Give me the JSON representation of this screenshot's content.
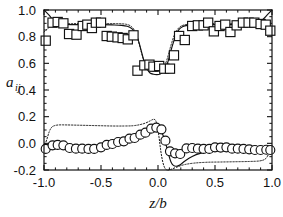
{
  "chart_data": {
    "type": "scatter",
    "title": "",
    "xlabel": "z/b",
    "ylabel": "a_ij",
    "xlim": [
      -1.0,
      1.0
    ],
    "ylim": [
      -0.2,
      1.0
    ],
    "grid": false,
    "legend": "none",
    "xticks": [
      -1.0,
      -0.5,
      0.0,
      0.5,
      1.0
    ],
    "xticklabels": [
      "-1.0",
      "-0.5",
      "0.0",
      "0.5",
      "1.0"
    ],
    "yticks": [
      -0.2,
      0.0,
      0.2,
      0.4,
      0.6,
      0.8,
      1.0
    ],
    "yticklabels": [
      "-0.2",
      "0.0",
      "0.2",
      "0.4",
      "0.6",
      "0.8",
      "1.0"
    ],
    "x_minor_step": 0.1,
    "y_minor_step": 0.05,
    "series": [
      {
        "name": "squares-data",
        "marker": "square",
        "style": "open-marker",
        "points": [
          [
            -0.985,
            0.77
          ],
          [
            -0.925,
            0.905
          ],
          [
            -0.88,
            0.91
          ],
          [
            -0.83,
            0.9
          ],
          [
            -0.78,
            0.82
          ],
          [
            -0.715,
            0.815
          ],
          [
            -0.66,
            0.88
          ],
          [
            -0.62,
            0.89
          ],
          [
            -0.58,
            0.865
          ],
          [
            -0.545,
            0.905
          ],
          [
            -0.5,
            0.905
          ],
          [
            -0.45,
            0.805
          ],
          [
            -0.405,
            0.8
          ],
          [
            -0.355,
            0.795
          ],
          [
            -0.31,
            0.79
          ],
          [
            -0.265,
            0.78
          ],
          [
            -0.215,
            0.81
          ],
          [
            -0.18,
            0.545
          ],
          [
            -0.12,
            0.585
          ],
          [
            -0.075,
            0.59
          ],
          [
            -0.04,
            0.575
          ],
          [
            0.01,
            0.58
          ],
          [
            0.055,
            0.56
          ],
          [
            0.105,
            0.56
          ],
          [
            0.14,
            0.66
          ],
          [
            0.185,
            0.805
          ],
          [
            0.235,
            0.775
          ],
          [
            0.3,
            0.88
          ],
          [
            0.35,
            0.885
          ],
          [
            0.4,
            0.885
          ],
          [
            0.44,
            0.905
          ],
          [
            0.49,
            0.84
          ],
          [
            0.54,
            0.88
          ],
          [
            0.59,
            0.89
          ],
          [
            0.635,
            0.835
          ],
          [
            0.69,
            0.885
          ],
          [
            0.745,
            0.905
          ],
          [
            0.795,
            0.905
          ],
          [
            0.845,
            0.905
          ],
          [
            0.9,
            0.895
          ],
          [
            0.945,
            0.89
          ],
          [
            0.985,
            0.845
          ]
        ]
      },
      {
        "name": "circles-data",
        "marker": "circle",
        "style": "open-marker",
        "points": [
          [
            -0.985,
            -0.042
          ],
          [
            -0.925,
            -0.015
          ],
          [
            -0.88,
            -0.012
          ],
          [
            -0.83,
            -0.015
          ],
          [
            -0.775,
            -0.035
          ],
          [
            -0.72,
            -0.04
          ],
          [
            -0.665,
            -0.04
          ],
          [
            -0.61,
            -0.042
          ],
          [
            -0.56,
            -0.042
          ],
          [
            -0.5,
            -0.03
          ],
          [
            -0.45,
            -0.012
          ],
          [
            -0.4,
            -0.005
          ],
          [
            -0.35,
            0.01
          ],
          [
            -0.3,
            0.015
          ],
          [
            -0.25,
            0.035
          ],
          [
            -0.205,
            0.04
          ],
          [
            -0.155,
            0.065
          ],
          [
            -0.11,
            0.08
          ],
          [
            -0.06,
            0.11
          ],
          [
            -0.015,
            0.118
          ],
          [
            0.03,
            0.105
          ],
          [
            0.065,
            0.02
          ],
          [
            0.105,
            -0.06
          ],
          [
            0.15,
            -0.075
          ],
          [
            0.195,
            -0.08
          ],
          [
            0.25,
            -0.038
          ],
          [
            0.3,
            -0.035
          ],
          [
            0.35,
            -0.04
          ],
          [
            0.4,
            -0.042
          ],
          [
            0.45,
            -0.042
          ],
          [
            0.5,
            -0.03
          ],
          [
            0.55,
            -0.032
          ],
          [
            0.6,
            -0.03
          ],
          [
            0.65,
            -0.04
          ],
          [
            0.7,
            -0.04
          ],
          [
            0.75,
            -0.042
          ],
          [
            0.8,
            -0.045
          ],
          [
            0.85,
            -0.05
          ],
          [
            0.9,
            -0.05
          ],
          [
            0.95,
            -0.048
          ],
          [
            0.985,
            -0.05
          ]
        ]
      },
      {
        "name": "squares-solid-line",
        "marker": "none",
        "style": "solid",
        "points": [
          [
            -1.0,
            1.0
          ],
          [
            -0.96,
            0.965
          ],
          [
            -0.93,
            0.935
          ],
          [
            -0.9,
            0.912
          ],
          [
            -0.86,
            0.898
          ],
          [
            -0.8,
            0.892
          ],
          [
            -0.7,
            0.89
          ],
          [
            -0.6,
            0.89
          ],
          [
            -0.5,
            0.89
          ],
          [
            -0.4,
            0.888
          ],
          [
            -0.32,
            0.885
          ],
          [
            -0.27,
            0.878
          ],
          [
            -0.23,
            0.86
          ],
          [
            -0.2,
            0.828
          ],
          [
            -0.175,
            0.78
          ],
          [
            -0.155,
            0.72
          ],
          [
            -0.135,
            0.655
          ],
          [
            -0.115,
            0.595
          ],
          [
            -0.095,
            0.555
          ],
          [
            -0.07,
            0.528
          ],
          [
            -0.04,
            0.518
          ],
          [
            -0.01,
            0.515
          ],
          [
            0.02,
            0.52
          ],
          [
            0.05,
            0.54
          ],
          [
            0.075,
            0.58
          ],
          [
            0.095,
            0.635
          ],
          [
            0.115,
            0.7
          ],
          [
            0.138,
            0.765
          ],
          [
            0.16,
            0.818
          ],
          [
            0.185,
            0.855
          ],
          [
            0.215,
            0.875
          ],
          [
            0.26,
            0.885
          ],
          [
            0.33,
            0.89
          ],
          [
            0.43,
            0.89
          ],
          [
            0.53,
            0.89
          ],
          [
            0.63,
            0.89
          ],
          [
            0.73,
            0.892
          ],
          [
            0.82,
            0.898
          ],
          [
            0.88,
            0.91
          ],
          [
            0.92,
            0.93
          ],
          [
            0.96,
            0.965
          ],
          [
            1.0,
            1.0
          ]
        ]
      },
      {
        "name": "squares-dotted-line",
        "marker": "none",
        "style": "dotted",
        "points": [
          [
            -1.0,
            0.835
          ],
          [
            -0.97,
            0.858
          ],
          [
            -0.94,
            0.878
          ],
          [
            -0.9,
            0.89
          ],
          [
            -0.85,
            0.895
          ],
          [
            -0.76,
            0.897
          ],
          [
            -0.65,
            0.898
          ],
          [
            -0.54,
            0.898
          ],
          [
            -0.43,
            0.898
          ],
          [
            -0.34,
            0.897
          ],
          [
            -0.28,
            0.893
          ],
          [
            -0.24,
            0.88
          ],
          [
            -0.21,
            0.852
          ],
          [
            -0.185,
            0.805
          ],
          [
            -0.165,
            0.745
          ],
          [
            -0.145,
            0.68
          ],
          [
            -0.125,
            0.62
          ],
          [
            -0.105,
            0.578
          ],
          [
            -0.08,
            0.552
          ],
          [
            -0.05,
            0.542
          ],
          [
            -0.015,
            0.54
          ],
          [
            0.02,
            0.548
          ],
          [
            0.05,
            0.57
          ],
          [
            0.072,
            0.612
          ],
          [
            0.092,
            0.668
          ],
          [
            0.112,
            0.73
          ],
          [
            0.135,
            0.792
          ],
          [
            0.16,
            0.84
          ],
          [
            0.19,
            0.872
          ],
          [
            0.23,
            0.888
          ],
          [
            0.3,
            0.896
          ],
          [
            0.4,
            0.898
          ],
          [
            0.52,
            0.898
          ],
          [
            0.64,
            0.898
          ],
          [
            0.75,
            0.897
          ],
          [
            0.84,
            0.894
          ],
          [
            0.9,
            0.888
          ],
          [
            0.945,
            0.875
          ],
          [
            0.975,
            0.858
          ],
          [
            1.0,
            0.838
          ]
        ]
      },
      {
        "name": "circles-solid-line",
        "marker": "none",
        "style": "solid",
        "points": [
          [
            -1.0,
            -0.06
          ],
          [
            -0.96,
            -0.048
          ],
          [
            -0.9,
            -0.04
          ],
          [
            -0.82,
            -0.038
          ],
          [
            -0.72,
            -0.036
          ],
          [
            -0.62,
            -0.032
          ],
          [
            -0.52,
            -0.025
          ],
          [
            -0.43,
            -0.015
          ],
          [
            -0.35,
            -0.002
          ],
          [
            -0.28,
            0.012
          ],
          [
            -0.22,
            0.028
          ],
          [
            -0.17,
            0.048
          ],
          [
            -0.13,
            0.068
          ],
          [
            -0.1,
            0.088
          ],
          [
            -0.075,
            0.105
          ],
          [
            -0.05,
            0.118
          ],
          [
            -0.025,
            0.125
          ],
          [
            0.0,
            0.122
          ],
          [
            0.02,
            0.105
          ],
          [
            0.04,
            0.07
          ],
          [
            0.06,
            0.02
          ],
          [
            0.08,
            -0.04
          ],
          [
            0.098,
            -0.098
          ],
          [
            0.115,
            -0.142
          ],
          [
            0.135,
            -0.165
          ],
          [
            0.16,
            -0.172
          ],
          [
            0.195,
            -0.16
          ],
          [
            0.24,
            -0.13
          ],
          [
            0.3,
            -0.098
          ],
          [
            0.37,
            -0.075
          ],
          [
            0.45,
            -0.062
          ],
          [
            0.54,
            -0.055
          ],
          [
            0.64,
            -0.05
          ],
          [
            0.74,
            -0.048
          ],
          [
            0.84,
            -0.048
          ],
          [
            0.93,
            -0.05
          ],
          [
            1.0,
            -0.055
          ]
        ]
      },
      {
        "name": "circles-dotted-line",
        "marker": "none",
        "style": "dotted",
        "points": [
          [
            -1.0,
            -0.03
          ],
          [
            -0.975,
            0.03
          ],
          [
            -0.955,
            0.085
          ],
          [
            -0.935,
            0.118
          ],
          [
            -0.91,
            0.132
          ],
          [
            -0.87,
            0.138
          ],
          [
            -0.8,
            0.138
          ],
          [
            -0.7,
            0.136
          ],
          [
            -0.6,
            0.134
          ],
          [
            -0.5,
            0.132
          ],
          [
            -0.4,
            0.13
          ],
          [
            -0.3,
            0.13
          ],
          [
            -0.22,
            0.132
          ],
          [
            -0.16,
            0.14
          ],
          [
            -0.11,
            0.152
          ],
          [
            -0.07,
            0.168
          ],
          [
            -0.04,
            0.18
          ],
          [
            -0.02,
            0.17
          ],
          [
            -0.005,
            0.12
          ],
          [
            0.01,
            0.04
          ],
          [
            0.025,
            -0.06
          ],
          [
            0.042,
            -0.14
          ],
          [
            0.06,
            -0.185
          ],
          [
            0.08,
            -0.2
          ],
          [
            0.11,
            -0.196
          ],
          [
            0.16,
            -0.18
          ],
          [
            0.23,
            -0.16
          ],
          [
            0.32,
            -0.148
          ],
          [
            0.43,
            -0.142
          ],
          [
            0.55,
            -0.14
          ],
          [
            0.68,
            -0.138
          ],
          [
            0.8,
            -0.136
          ],
          [
            0.89,
            -0.132
          ],
          [
            0.94,
            -0.118
          ],
          [
            0.968,
            -0.085
          ],
          [
            0.985,
            -0.05
          ],
          [
            1.0,
            -0.03
          ]
        ]
      }
    ]
  }
}
